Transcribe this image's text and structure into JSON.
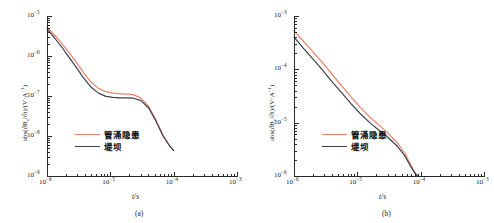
{
  "figure": {
    "panels": [
      {
        "caption": "(a)",
        "xlabel_var": "t",
        "xlabel_unit": "/s",
        "ylabel": "abs(∂B",
        "ylabel_sub": "z",
        "ylabel_mid": "/∂t)/(V·A",
        "ylabel_sup": "−1",
        "ylabel_end": ")",
        "x_ticks": [
          {
            "mant": "10",
            "exp": "−6"
          },
          {
            "mant": "10",
            "exp": "−5"
          },
          {
            "mant": "10",
            "exp": "−4"
          },
          {
            "mant": "10",
            "exp": "−3"
          }
        ],
        "y_ticks": [
          {
            "mant": "10",
            "exp": "−5"
          },
          {
            "mant": "10",
            "exp": "−6"
          },
          {
            "mant": "10",
            "exp": "−7"
          },
          {
            "mant": "10",
            "exp": "−8"
          },
          {
            "mant": "10",
            "exp": "−9"
          }
        ],
        "legend": [
          {
            "label": "管涌隐患",
            "color": "#e8836b"
          },
          {
            "label": "堤坝",
            "color": "#39424f"
          }
        ]
      },
      {
        "caption": "(b)",
        "xlabel_var": "t",
        "xlabel_unit": "/s",
        "ylabel": "abs(∂B",
        "ylabel_sub": "y",
        "ylabel_mid": "/∂t)/(V·A",
        "ylabel_sup": "−1",
        "ylabel_end": ")",
        "x_ticks": [
          {
            "mant": "10",
            "exp": "−6"
          },
          {
            "mant": "10",
            "exp": "−5"
          },
          {
            "mant": "10",
            "exp": "−4"
          },
          {
            "mant": "10",
            "exp": "−3"
          }
        ],
        "y_ticks": [
          {
            "mant": "10",
            "exp": "−3"
          },
          {
            "mant": "10",
            "exp": "−4"
          },
          {
            "mant": "10",
            "exp": "−5"
          },
          {
            "mant": "10",
            "exp": "−6"
          }
        ],
        "legend": [
          {
            "label": "管涌隐患",
            "color": "#e8836b"
          },
          {
            "label": "堤坝",
            "color": "#39424f"
          }
        ]
      }
    ]
  },
  "chart_data": [
    {
      "type": "line",
      "title": "",
      "subplot": "(a)",
      "xlabel": "t/s",
      "ylabel": "abs(∂Bz/∂t)/(V·A⁻¹)",
      "xscale": "log",
      "yscale": "log",
      "xlim": [
        1e-06,
        0.001
      ],
      "ylim": [
        1e-09,
        1e-05
      ],
      "grid": false,
      "legend_position": "lower-left-inside",
      "series": [
        {
          "name": "管涌隐患",
          "color": "#e8836b",
          "x": [
            1e-06,
            1.3e-06,
            1.7e-06,
            2.2e-06,
            2.9e-06,
            3.8e-06,
            5e-06,
            6.5e-06,
            8.5e-06,
            1.1e-05,
            1.4e-05,
            1.8e-05,
            2.3e-05,
            3e-05,
            4e-05,
            5.2e-05,
            6.8e-05,
            8.5e-05,
            0.0001
          ],
          "y": [
            5.2e-06,
            3.4e-06,
            2.1e-06,
            1.25e-06,
            7e-07,
            3.8e-07,
            2.2e-07,
            1.55e-07,
            1.28e-07,
            1.18e-07,
            1.14e-07,
            1.12e-07,
            1.08e-07,
            9e-08,
            5.6e-08,
            2.6e-08,
            1.05e-08,
            6e-09,
            4.4e-09
          ]
        },
        {
          "name": "堤坝",
          "color": "#39424f",
          "x": [
            1e-06,
            1.3e-06,
            1.7e-06,
            2.2e-06,
            2.9e-06,
            3.8e-06,
            5e-06,
            6.5e-06,
            8.5e-06,
            1.1e-05,
            1.4e-05,
            1.8e-05,
            2.3e-05,
            3e-05,
            4e-05,
            5.2e-05,
            6.8e-05,
            8.5e-05,
            0.0001
          ],
          "y": [
            4.7e-06,
            2.9e-06,
            1.7e-06,
            9.5e-07,
            5.2e-07,
            2.8e-07,
            1.65e-07,
            1.18e-07,
            9.8e-08,
            9.2e-08,
            9e-08,
            9e-08,
            8.8e-08,
            7.8e-08,
            5.1e-08,
            2.45e-08,
            1e-08,
            5.8e-09,
            4.3e-09
          ]
        }
      ]
    },
    {
      "type": "line",
      "title": "",
      "subplot": "(b)",
      "xlabel": "t/s",
      "ylabel": "abs(∂By/∂t)/(V·A⁻¹)",
      "xscale": "log",
      "yscale": "log",
      "xlim": [
        1e-06,
        0.001
      ],
      "ylim": [
        1e-06,
        0.001
      ],
      "grid": false,
      "legend_position": "lower-left-inside",
      "series": [
        {
          "name": "管涌隐患",
          "color": "#e8836b",
          "x": [
            1e-06,
            1.4e-06,
            2e-06,
            2.8e-06,
            4e-06,
            5.6e-06,
            8e-06,
            1.1e-05,
            1.6e-05,
            2.2e-05,
            3e-05,
            4.2e-05,
            5.6e-05,
            7e-05,
            8e-05,
            8.8e-05,
            9.2e-05
          ],
          "y": [
            0.00053,
            0.00034,
            0.00021,
            0.000135,
            8e-05,
            5e-05,
            3e-05,
            1.95e-05,
            1.25e-05,
            9e-06,
            6.5e-06,
            4.3e-06,
            2.7e-06,
            1.6e-06,
            1.2e-06,
            1.03e-06,
            1e-06
          ]
        },
        {
          "name": "堤坝",
          "color": "#39424f",
          "x": [
            1e-06,
            1.4e-06,
            2e-06,
            2.8e-06,
            4e-06,
            5.6e-06,
            8e-06,
            1.1e-05,
            1.6e-05,
            2.2e-05,
            3e-05,
            4.2e-05,
            5.6e-05,
            7e-05,
            8e-05,
            8.8e-05,
            9.2e-05
          ],
          "y": [
            0.0004,
            0.00025,
            0.000155,
            9.8e-05,
            5.8e-05,
            3.7e-05,
            2.25e-05,
            1.5e-05,
            9.8e-06,
            7.2e-06,
            5.4e-06,
            3.7e-06,
            2.4e-06,
            1.5e-06,
            1.15e-06,
            1.02e-06,
            1e-06
          ]
        }
      ]
    }
  ]
}
